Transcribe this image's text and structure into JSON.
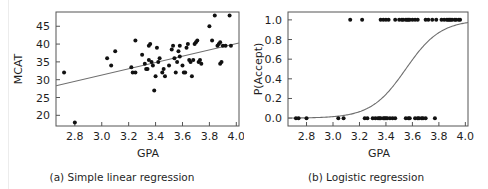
{
  "figure": {
    "background": "#ffffff",
    "rule_color": "#ececec",
    "axis_color": "#555555",
    "point_color": "#111111",
    "line_color": "#6e6e6e"
  },
  "panels": [
    {
      "id": "panel-a",
      "caption": "(a) Simple linear regression",
      "xlabel": "GPA",
      "ylabel": "MCAT"
    },
    {
      "id": "panel-b",
      "caption": "(b) Logistic regression",
      "xlabel": "GPA",
      "ylabel": "P(Accept)"
    }
  ],
  "chart_data": [
    {
      "type": "scatter",
      "title": "(a) Simple linear regression",
      "xlabel": "GPA",
      "ylabel": "MCAT",
      "xlim": [
        2.66,
        4.02
      ],
      "ylim": [
        17.0,
        49.0
      ],
      "xticks": [
        2.8,
        3.0,
        3.2,
        3.4,
        3.6,
        3.8,
        4.0
      ],
      "xticklabels": [
        "2.8",
        "3.0",
        "3.2",
        "3.4",
        "3.6",
        "3.8",
        "4.0"
      ],
      "yticks": [
        20,
        25,
        30,
        35,
        40,
        45
      ],
      "yticklabels": [
        "20",
        "25",
        "30",
        "35",
        "40",
        "45"
      ],
      "grid": false,
      "legend": null,
      "fit_line": {
        "kind": "linear",
        "x_start": 2.66,
        "y_start": 28.3,
        "x_end": 4.02,
        "y_end": 40.3,
        "color": "#6e6e6e"
      },
      "points": [
        [
          2.72,
          32.0
        ],
        [
          2.8,
          18.0
        ],
        [
          3.04,
          36.0
        ],
        [
          3.07,
          34.0
        ],
        [
          3.1,
          38.0
        ],
        [
          3.22,
          33.5
        ],
        [
          3.23,
          32.0
        ],
        [
          3.25,
          32.0
        ],
        [
          3.25,
          41.0
        ],
        [
          3.3,
          37.0
        ],
        [
          3.32,
          34.5
        ],
        [
          3.33,
          33.0
        ],
        [
          3.34,
          33.0
        ],
        [
          3.35,
          35.5
        ],
        [
          3.35,
          39.5
        ],
        [
          3.36,
          40.0
        ],
        [
          3.37,
          35.0
        ],
        [
          3.38,
          34.0
        ],
        [
          3.39,
          27.0
        ],
        [
          3.4,
          31.0
        ],
        [
          3.41,
          39.0
        ],
        [
          3.42,
          35.0
        ],
        [
          3.43,
          36.0
        ],
        [
          3.45,
          32.0
        ],
        [
          3.46,
          33.0
        ],
        [
          3.47,
          31.0
        ],
        [
          3.5,
          34.0
        ],
        [
          3.52,
          38.5
        ],
        [
          3.53,
          39.5
        ],
        [
          3.54,
          36.0
        ],
        [
          3.55,
          32.0
        ],
        [
          3.56,
          35.0
        ],
        [
          3.57,
          38.0
        ],
        [
          3.58,
          39.5
        ],
        [
          3.58,
          36.5
        ],
        [
          3.6,
          34.0
        ],
        [
          3.61,
          32.0
        ],
        [
          3.62,
          32.0
        ],
        [
          3.63,
          39.0
        ],
        [
          3.64,
          40.0
        ],
        [
          3.65,
          35.5
        ],
        [
          3.66,
          35.0
        ],
        [
          3.67,
          31.0
        ],
        [
          3.68,
          35.5
        ],
        [
          3.69,
          40.0
        ],
        [
          3.7,
          40.5
        ],
        [
          3.71,
          41.0
        ],
        [
          3.72,
          35.0
        ],
        [
          3.73,
          35.5
        ],
        [
          3.74,
          34.5
        ],
        [
          3.8,
          45.0
        ],
        [
          3.82,
          41.0
        ],
        [
          3.84,
          48.0
        ],
        [
          3.86,
          39.5
        ],
        [
          3.87,
          40.0
        ],
        [
          3.88,
          40.5
        ],
        [
          3.88,
          34.5
        ],
        [
          3.89,
          35.0
        ],
        [
          3.9,
          39.5
        ],
        [
          3.92,
          39.5
        ],
        [
          3.95,
          48.0
        ],
        [
          3.96,
          39.5
        ]
      ]
    },
    {
      "type": "scatter",
      "title": "(b) Logistic regression",
      "xlabel": "GPA",
      "ylabel": "P(Accept)",
      "xlim": [
        2.66,
        4.02
      ],
      "ylim": [
        -0.08,
        1.08
      ],
      "xticks": [
        2.8,
        3.0,
        3.2,
        3.4,
        3.6,
        3.8,
        4.0
      ],
      "xticklabels": [
        "2.8",
        "3.0",
        "3.2",
        "3.4",
        "3.6",
        "3.8",
        "4.0"
      ],
      "yticks": [
        0.0,
        0.2,
        0.4,
        0.6,
        0.8,
        1.0
      ],
      "yticklabels": [
        "0.0",
        "0.2",
        "0.4",
        "0.6",
        "0.8",
        "1.0"
      ],
      "grid": false,
      "legend": null,
      "fit_curve": {
        "kind": "logistic",
        "midpoint_x": 3.55,
        "slope": 7.6,
        "color": "#6e6e6e"
      },
      "points_y1": [
        [
          3.13,
          1.0
        ],
        [
          3.22,
          1.0
        ],
        [
          3.36,
          1.0
        ],
        [
          3.38,
          1.0
        ],
        [
          3.4,
          1.0
        ],
        [
          3.42,
          1.0
        ],
        [
          3.47,
          1.0
        ],
        [
          3.5,
          1.0
        ],
        [
          3.52,
          1.0
        ],
        [
          3.53,
          1.0
        ],
        [
          3.55,
          1.0
        ],
        [
          3.56,
          1.0
        ],
        [
          3.57,
          1.0
        ],
        [
          3.58,
          1.0
        ],
        [
          3.6,
          1.0
        ],
        [
          3.62,
          1.0
        ],
        [
          3.64,
          1.0
        ],
        [
          3.7,
          1.0
        ],
        [
          3.72,
          1.0
        ],
        [
          3.75,
          1.0
        ],
        [
          3.78,
          1.0
        ],
        [
          3.82,
          1.0
        ],
        [
          3.84,
          1.0
        ],
        [
          3.86,
          1.0
        ],
        [
          3.87,
          1.0
        ],
        [
          3.88,
          1.0
        ],
        [
          3.89,
          1.0
        ],
        [
          3.9,
          1.0
        ],
        [
          3.92,
          1.0
        ],
        [
          3.93,
          1.0
        ],
        [
          3.95,
          1.0
        ],
        [
          3.96,
          1.0
        ]
      ],
      "points_y0": [
        [
          2.72,
          0.0
        ],
        [
          2.74,
          0.0
        ],
        [
          2.8,
          0.0
        ],
        [
          3.04,
          0.0
        ],
        [
          3.08,
          0.0
        ],
        [
          3.24,
          0.0
        ],
        [
          3.26,
          0.0
        ],
        [
          3.3,
          0.0
        ],
        [
          3.32,
          0.0
        ],
        [
          3.34,
          0.0
        ],
        [
          3.35,
          0.0
        ],
        [
          3.36,
          0.0
        ],
        [
          3.38,
          0.0
        ],
        [
          3.39,
          0.0
        ],
        [
          3.4,
          0.0
        ],
        [
          3.41,
          0.0
        ],
        [
          3.43,
          0.0
        ],
        [
          3.45,
          0.0
        ],
        [
          3.47,
          0.0
        ],
        [
          3.55,
          0.0
        ],
        [
          3.57,
          0.0
        ],
        [
          3.58,
          0.0
        ],
        [
          3.62,
          0.0
        ],
        [
          3.64,
          0.0
        ],
        [
          3.65,
          0.0
        ],
        [
          3.67,
          0.0
        ],
        [
          3.68,
          0.0
        ],
        [
          3.7,
          0.0
        ],
        [
          3.77,
          0.0
        ]
      ]
    }
  ]
}
